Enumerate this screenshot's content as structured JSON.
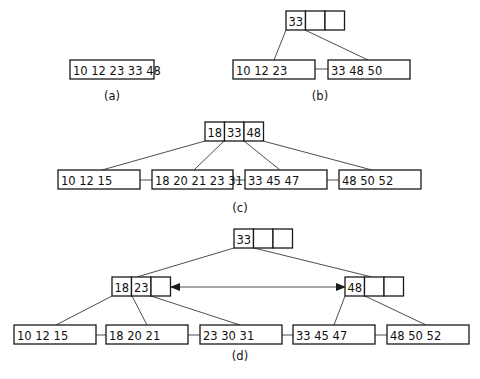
{
  "diagram": {
    "colors": {
      "stroke": "#1a1a1a",
      "edge": "#3a3a3a",
      "text": "#111111",
      "background": "#ffffff"
    },
    "panels": [
      {
        "id": "a",
        "caption": "(a)",
        "caption_pos": [
          112,
          100
        ],
        "nodes": [
          {
            "id": "a_leaf",
            "kind": "leaf",
            "keys": "10 12 23 33 48",
            "x": 70,
            "y": 60,
            "w": 84,
            "h": 19
          }
        ],
        "edges": [],
        "siblings": []
      },
      {
        "id": "b",
        "caption": "(b)",
        "caption_pos": [
          320,
          100
        ],
        "nodes": [
          {
            "id": "b_root",
            "kind": "internal",
            "cells": [
              "33",
              "",
              ""
            ],
            "x": 286,
            "y": 11,
            "cw": 19.5,
            "h": 19
          },
          {
            "id": "b_l1",
            "kind": "leaf",
            "keys": "10 12 23",
            "x": 233,
            "y": 60,
            "w": 82,
            "h": 19
          },
          {
            "id": "b_l2",
            "kind": "leaf",
            "keys": "33 48 50",
            "x": 328,
            "y": 60,
            "w": 82,
            "h": 19
          }
        ],
        "edges": [
          {
            "from": [
              286,
              30
            ],
            "to": [
              274,
              60
            ]
          },
          {
            "from": [
              305,
              30
            ],
            "to": [
              368,
              60
            ]
          }
        ],
        "siblings": [
          {
            "from": [
              315,
              69
            ],
            "to": [
              328,
              69
            ]
          }
        ]
      },
      {
        "id": "c",
        "caption": "(c)",
        "caption_pos": [
          240,
          212
        ],
        "nodes": [
          {
            "id": "c_root",
            "kind": "internal",
            "cells": [
              "18",
              "33",
              "48"
            ],
            "x": 205,
            "y": 122,
            "cw": 19.5,
            "h": 19
          },
          {
            "id": "c_l1",
            "kind": "leaf",
            "keys": "10 12 15",
            "x": 58,
            "y": 170,
            "w": 82,
            "h": 19
          },
          {
            "id": "c_l2",
            "kind": "leaf",
            "keys": "18 20 21 23 31",
            "x": 152,
            "y": 170,
            "w": 81,
            "h": 19
          },
          {
            "id": "c_l3",
            "kind": "leaf",
            "keys": "33 45 47",
            "x": 245,
            "y": 170,
            "w": 82,
            "h": 19
          },
          {
            "id": "c_l4",
            "kind": "leaf",
            "keys": "48 50 52",
            "x": 339,
            "y": 170,
            "w": 82,
            "h": 19
          }
        ],
        "edges": [
          {
            "from": [
              205,
              141
            ],
            "to": [
              102,
              170
            ]
          },
          {
            "from": [
              224,
              141
            ],
            "to": [
              194,
              170
            ]
          },
          {
            "from": [
              244,
              141
            ],
            "to": [
              280,
              170
            ]
          },
          {
            "from": [
              263,
              141
            ],
            "to": [
              372,
              170
            ]
          }
        ],
        "siblings": [
          {
            "from": [
              140,
              180
            ],
            "to": [
              152,
              180
            ]
          },
          {
            "from": [
              233,
              180
            ],
            "to": [
              245,
              180
            ]
          },
          {
            "from": [
              327,
              180
            ],
            "to": [
              339,
              180
            ]
          }
        ]
      },
      {
        "id": "d",
        "caption": "(d)",
        "caption_pos": [
          240,
          360
        ],
        "nodes": [
          {
            "id": "d_root",
            "kind": "internal",
            "cells": [
              "33",
              "",
              ""
            ],
            "x": 234,
            "y": 229,
            "cw": 19.5,
            "h": 19
          },
          {
            "id": "d_i1",
            "kind": "internal",
            "cells": [
              "18",
              "23",
              ""
            ],
            "x": 112,
            "y": 277,
            "cw": 19.5,
            "h": 19
          },
          {
            "id": "d_i2",
            "kind": "internal",
            "cells": [
              "48",
              "",
              ""
            ],
            "x": 345,
            "y": 277,
            "cw": 19.5,
            "h": 19
          },
          {
            "id": "d_l1",
            "kind": "leaf",
            "keys": "10 12 15",
            "x": 14,
            "y": 325,
            "w": 82,
            "h": 19
          },
          {
            "id": "d_l2",
            "kind": "leaf",
            "keys": "18 20 21",
            "x": 106,
            "y": 325,
            "w": 82,
            "h": 19
          },
          {
            "id": "d_l3",
            "kind": "leaf",
            "keys": "23 30 31",
            "x": 200,
            "y": 325,
            "w": 82,
            "h": 19
          },
          {
            "id": "d_l4",
            "kind": "leaf",
            "keys": "33 45 47",
            "x": 293,
            "y": 325,
            "w": 82,
            "h": 19
          },
          {
            "id": "d_l5",
            "kind": "leaf",
            "keys": "48 50 52",
            "x": 387,
            "y": 325,
            "w": 82,
            "h": 19
          }
        ],
        "edges": [
          {
            "from": [
              234,
              248
            ],
            "to": [
              137,
              277
            ]
          },
          {
            "from": [
              254,
              248
            ],
            "to": [
              372,
              277
            ]
          },
          {
            "from": [
              112,
              296
            ],
            "to": [
              56,
              325
            ]
          },
          {
            "from": [
              132,
              296
            ],
            "to": [
              147,
              325
            ]
          },
          {
            "from": [
              151,
              296
            ],
            "to": [
              240,
              325
            ]
          },
          {
            "from": [
              345,
              296
            ],
            "to": [
              334,
              325
            ]
          },
          {
            "from": [
              365,
              296
            ],
            "to": [
              426,
              325
            ]
          }
        ],
        "siblings": [
          {
            "from": [
              96,
              335
            ],
            "to": [
              106,
              335
            ]
          },
          {
            "from": [
              188,
              335
            ],
            "to": [
              200,
              335
            ]
          },
          {
            "from": [
              282,
              335
            ],
            "to": [
              293,
              335
            ]
          },
          {
            "from": [
              375,
              335
            ],
            "to": [
              387,
              335
            ]
          }
        ],
        "arrows": [
          {
            "from": [
              171,
              287
            ],
            "to": [
              345,
              287
            ],
            "bidirectional": true
          }
        ]
      }
    ]
  }
}
